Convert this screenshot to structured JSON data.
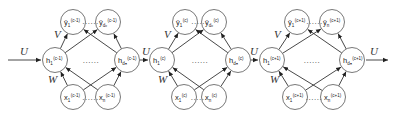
{
  "diagram": {
    "title": "",
    "type": "unrolled recurrent neural network",
    "weight_labels": {
      "input_to_hidden": "W",
      "hidden_to_output": "V",
      "hidden_to_hidden": "U"
    },
    "ellipsis": "......",
    "blocks": [
      {
        "time": "(c-1)",
        "outputs": [
          {
            "label": "ŷ",
            "sub": "1",
            "sup": "(c-1)"
          },
          {
            "label": "ŷ",
            "sub": "dₒ",
            "sup": "(c-1)"
          }
        ],
        "hidden": [
          {
            "label": "h",
            "sub": "1",
            "sup": "(c-1)"
          },
          {
            "label": "h",
            "sub": "dₕ",
            "sup": "(c-1)"
          }
        ],
        "inputs": [
          {
            "label": "x",
            "sub": "1",
            "sup": "(c-1)"
          },
          {
            "label": "x",
            "sub": "n",
            "sup": "(c-1)"
          }
        ]
      },
      {
        "time": "(c)",
        "outputs": [
          {
            "label": "ŷ",
            "sub": "1",
            "sup": "(c)"
          },
          {
            "label": "ŷ",
            "sub": "dₒ",
            "sup": "(c)"
          }
        ],
        "hidden": [
          {
            "label": "h",
            "sub": "1",
            "sup": "(c)"
          },
          {
            "label": "h",
            "sub": "dₕ",
            "sup": "(c)"
          }
        ],
        "inputs": [
          {
            "label": "x",
            "sub": "1",
            "sup": "(c)"
          },
          {
            "label": "x",
            "sub": "n",
            "sup": "(c)"
          }
        ]
      },
      {
        "time": "(c+1)",
        "outputs": [
          {
            "label": "ŷ",
            "sub": "1",
            "sup": "(c+1)"
          },
          {
            "label": "ŷ",
            "sub": "n",
            "sup": "(c+1)"
          }
        ],
        "hidden": [
          {
            "label": "h",
            "sub": "1",
            "sup": "(c+1)"
          },
          {
            "label": "h",
            "sub": "dₕ",
            "sup": "(c+1)"
          }
        ],
        "inputs": [
          {
            "label": "x",
            "sub": "1",
            "sup": "(c+1)"
          },
          {
            "label": "x",
            "sub": "n",
            "sup": "(c+1)"
          }
        ]
      }
    ]
  }
}
